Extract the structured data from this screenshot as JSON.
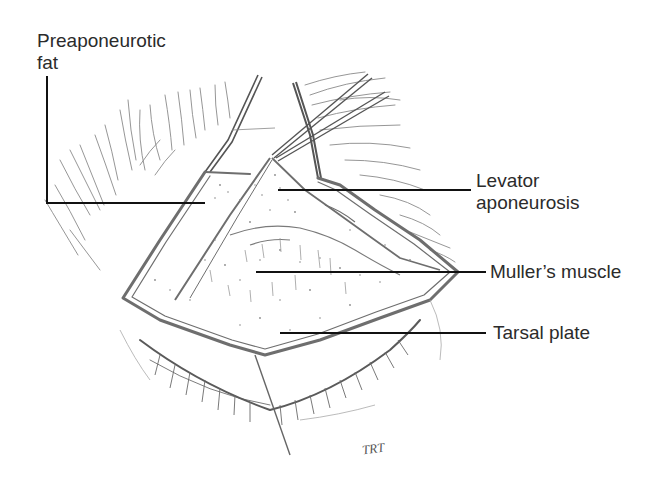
{
  "figure": {
    "type": "anatomical line illustration",
    "labels": [
      {
        "id": "preaponeurotic-fat",
        "lines": [
          "Preaponeurotic",
          "fat"
        ]
      },
      {
        "id": "levator-aponeurosis",
        "lines": [
          "Levator",
          "aponeurosis"
        ]
      },
      {
        "id": "mullers-muscle",
        "lines": [
          "Muller’s muscle"
        ]
      },
      {
        "id": "tarsal-plate",
        "lines": [
          "Tarsal plate"
        ]
      }
    ],
    "signature": "TRT",
    "colors": {
      "ink": "#2b2b2b",
      "sketch": "#6e6e6e",
      "leader": "#111111",
      "background": "#ffffff"
    }
  }
}
